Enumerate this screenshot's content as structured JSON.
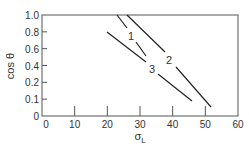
{
  "chart_data": {
    "type": "line",
    "title": "",
    "xlabel": "σ_L",
    "xlabel_main": "σ",
    "xlabel_sub": "L",
    "ylabel": "cos θ",
    "xlim": [
      0,
      60
    ],
    "x_ticks": [
      "0",
      "10",
      "20",
      "30",
      "40",
      "50",
      "60"
    ],
    "y_ticks": [
      "0",
      "0.1",
      "0.2",
      "0.4",
      "0.6",
      "0.8",
      "1.0"
    ],
    "grid": false,
    "legend": "inline labels",
    "series": [
      {
        "name": "1",
        "points": [
          [
            23.1,
            1.0
          ],
          [
            32.0,
            0.49
          ]
        ]
      },
      {
        "name": "2",
        "points": [
          [
            26.2,
            1.0
          ],
          [
            52.0,
            0.06
          ]
        ]
      },
      {
        "name": "3",
        "points": [
          [
            20.0,
            0.8
          ],
          [
            46.2,
            0.12
          ]
        ]
      }
    ]
  },
  "plot": {
    "left": 42,
    "right": 238,
    "top": 15,
    "bottom": 116,
    "line_color": "#222222",
    "segments": [
      {
        "series": "1",
        "x1": 117,
        "y1": 15,
        "x2": 127,
        "y2": 28
      },
      {
        "series": "1",
        "x1": 136,
        "y1": 42,
        "x2": 146,
        "y2": 56
      },
      {
        "series": "2",
        "x1": 127,
        "y1": 15,
        "x2": 165,
        "y2": 52
      },
      {
        "series": "2",
        "x1": 176,
        "y1": 67,
        "x2": 211,
        "y2": 107
      },
      {
        "series": "3",
        "x1": 107,
        "y1": 32,
        "x2": 146,
        "y2": 62
      },
      {
        "series": "3",
        "x1": 158,
        "y1": 74,
        "x2": 192,
        "y2": 101
      }
    ],
    "labels": [
      {
        "text": "1",
        "x": 131,
        "y": 40
      },
      {
        "text": "2",
        "x": 169,
        "y": 64
      },
      {
        "text": "3",
        "x": 152,
        "y": 73
      }
    ]
  }
}
